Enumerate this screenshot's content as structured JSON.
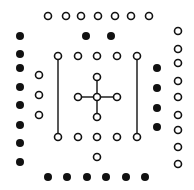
{
  "diagram": {
    "width": 194,
    "height": 190,
    "background": "#ffffff",
    "stroke_color": "#111111",
    "fill_color": "#111111",
    "open_radius": 4,
    "filled_radius": 4,
    "stroke_width": 1.6,
    "groups": [
      {
        "name": "top-open-row",
        "style": "open",
        "points": [
          [
            48,
            16
          ],
          [
            66,
            16
          ],
          [
            81,
            16
          ],
          [
            98,
            16
          ],
          [
            115,
            16
          ],
          [
            131,
            16
          ],
          [
            149,
            16
          ]
        ]
      },
      {
        "name": "top-inner-filled-pair",
        "style": "filled",
        "points": [
          [
            86,
            36
          ],
          [
            111,
            36
          ]
        ]
      },
      {
        "name": "left-filled-column",
        "style": "filled",
        "points": [
          [
            20,
            36
          ],
          [
            20,
            54
          ],
          [
            20,
            68
          ],
          [
            20,
            87
          ],
          [
            20,
            105
          ],
          [
            20,
            125
          ],
          [
            20,
            143
          ],
          [
            20,
            162
          ]
        ]
      },
      {
        "name": "left-open-column",
        "style": "open",
        "points": [
          [
            39,
            75
          ],
          [
            39,
            95
          ],
          [
            39,
            115
          ]
        ]
      },
      {
        "name": "inner-top-open-row",
        "style": "open",
        "points": [
          [
            58,
            56
          ],
          [
            78,
            56
          ],
          [
            97,
            56
          ],
          [
            117,
            56
          ],
          [
            137,
            56
          ]
        ]
      },
      {
        "name": "inner-bottom-open-row",
        "style": "open",
        "points": [
          [
            58,
            137
          ],
          [
            78,
            137
          ],
          [
            97,
            137
          ],
          [
            117,
            137
          ],
          [
            137,
            137
          ]
        ]
      },
      {
        "name": "bottom-center-open",
        "style": "open",
        "points": [
          [
            97,
            157
          ]
        ]
      },
      {
        "name": "cross-nodes",
        "style": "open",
        "points": [
          [
            97,
            77
          ],
          [
            78,
            97
          ],
          [
            97,
            97
          ],
          [
            117,
            97
          ],
          [
            97,
            117
          ]
        ]
      },
      {
        "name": "right-filled-column",
        "style": "filled",
        "points": [
          [
            157,
            68
          ],
          [
            157,
            88
          ],
          [
            157,
            108
          ],
          [
            157,
            127
          ]
        ]
      },
      {
        "name": "right-open-column",
        "style": "open",
        "points": [
          [
            178,
            31
          ],
          [
            178,
            49
          ],
          [
            178,
            63
          ],
          [
            178,
            81
          ],
          [
            178,
            97
          ],
          [
            178,
            115
          ],
          [
            178,
            130
          ],
          [
            178,
            147
          ],
          [
            178,
            164
          ]
        ]
      },
      {
        "name": "bottom-filled-row",
        "style": "filled",
        "points": [
          [
            48,
            177
          ],
          [
            67,
            177
          ],
          [
            87,
            177
          ],
          [
            106,
            177
          ],
          [
            126,
            177
          ],
          [
            145,
            177
          ]
        ]
      }
    ],
    "lines": [
      {
        "name": "left-vertical-line",
        "from": [
          58,
          60
        ],
        "to": [
          58,
          133
        ]
      },
      {
        "name": "right-vertical-line",
        "from": [
          137,
          60
        ],
        "to": [
          137,
          133
        ]
      },
      {
        "name": "cross-vertical-line",
        "from": [
          97,
          81
        ],
        "to": [
          97,
          113
        ]
      },
      {
        "name": "cross-horizontal-line",
        "from": [
          82,
          97
        ],
        "to": [
          113,
          97
        ]
      }
    ]
  }
}
